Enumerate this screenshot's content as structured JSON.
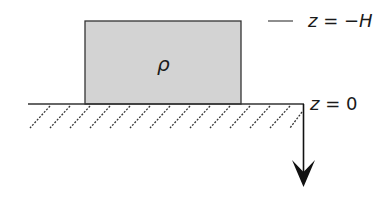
{
  "diagram": {
    "block": {
      "label": "ρ",
      "fill": "#d3d3d3",
      "stroke": "#333333"
    },
    "labels": {
      "top_level": {
        "var": "z",
        "eq": " = ",
        "value": "−H"
      },
      "ground_level": {
        "var": "z",
        "eq": " = ",
        "value": "0"
      }
    },
    "axis": {
      "direction": "down",
      "description": "z-axis pointing downward"
    },
    "ground": {
      "style": "hatched",
      "hatch_count": 14
    }
  }
}
